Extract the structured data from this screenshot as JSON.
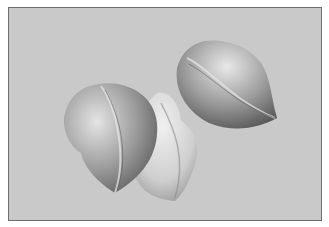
{
  "image": {
    "description": "Grayscale illustration of three petal-shaped objects (peach-like) on a light gray background with a thin dark border",
    "subjects": [
      {
        "name": "left-petal",
        "shade": "mid-gray"
      },
      {
        "name": "center-petal",
        "shade": "light-gray"
      },
      {
        "name": "upper-right-petal",
        "shade": "mid-gray"
      }
    ],
    "colors": {
      "background": "#c9c9c9",
      "border": "#6e6e6e",
      "dark_shade": "#5a5a5a",
      "light_shade": "#e6e6e6"
    }
  }
}
